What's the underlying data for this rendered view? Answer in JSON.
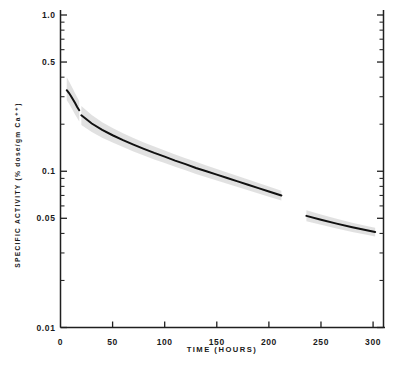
{
  "figure": {
    "background_color": "#ffffff",
    "ink_color": "#1a1a1a",
    "band_color": "#b8b8b8",
    "curve_color": "#111111"
  },
  "axes": {
    "x_title": "TIME (HOURS)",
    "y_title": "SPECIFIC ACTIVITY  (% dose/gm Ca⁺⁺)",
    "origin_label": "0",
    "x_tick_labels": [
      "50",
      "100",
      "150",
      "200",
      "250",
      "300"
    ],
    "y_tick_labels": [
      "1.0",
      "0.5",
      "0.1",
      "0.05",
      "0.01"
    ]
  },
  "chart_data": {
    "type": "line",
    "title": "",
    "subtitle": "",
    "xlabel": "TIME (HOURS)",
    "ylabel": "SPECIFIC ACTIVITY (% dose/gm Ca++)",
    "x_scale": "linear",
    "y_scale": "log",
    "xlim": [
      0,
      310
    ],
    "ylim": [
      0.01,
      1.0
    ],
    "grid": false,
    "legend": "none",
    "x_ticks": [
      0,
      50,
      100,
      150,
      200,
      250,
      300
    ],
    "y_ticks": [
      0.01,
      0.02,
      0.03,
      0.04,
      0.05,
      0.06,
      0.07,
      0.08,
      0.09,
      0.1,
      0.2,
      0.3,
      0.4,
      0.5,
      0.6,
      0.7,
      0.8,
      0.9,
      1.0
    ],
    "y_labeled_ticks": [
      {
        "value": 1.0,
        "label": "1.0"
      },
      {
        "value": 0.5,
        "label": "0.5"
      },
      {
        "value": 0.1,
        "label": "0.1"
      },
      {
        "value": 0.05,
        "label": "0.05"
      },
      {
        "value": 0.01,
        "label": "0.01"
      }
    ],
    "annotations": [
      "curve discontinuity between 212 and 236 hours"
    ],
    "series": [
      {
        "name": "segment-1-early",
        "x": [
          6,
          8,
          10,
          12,
          14,
          16,
          18
        ],
        "values": [
          0.33,
          0.318,
          0.303,
          0.288,
          0.273,
          0.258,
          0.246
        ],
        "band_upper": [
          0.4,
          0.378,
          0.356,
          0.336,
          0.316,
          0.298,
          0.282
        ],
        "band_lower": [
          0.285,
          0.272,
          0.258,
          0.244,
          0.231,
          0.219,
          0.208
        ]
      },
      {
        "name": "segment-2-main",
        "x": [
          20,
          30,
          40,
          50,
          60,
          70,
          80,
          90,
          100,
          110,
          120,
          130,
          140,
          150,
          160,
          170,
          180,
          190,
          200,
          212
        ],
        "values": [
          0.228,
          0.202,
          0.184,
          0.17,
          0.158,
          0.148,
          0.139,
          0.131,
          0.124,
          0.117,
          0.111,
          0.105,
          0.1,
          0.0952,
          0.0905,
          0.0862,
          0.082,
          0.078,
          0.0742,
          0.07
        ],
        "band_upper": [
          0.262,
          0.229,
          0.206,
          0.189,
          0.175,
          0.163,
          0.153,
          0.144,
          0.136,
          0.128,
          0.121,
          0.115,
          0.109,
          0.1035,
          0.0982,
          0.0933,
          0.0886,
          0.0841,
          0.0798,
          0.0751
        ],
        "band_lower": [
          0.198,
          0.178,
          0.164,
          0.153,
          0.143,
          0.134,
          0.126,
          0.119,
          0.1129,
          0.1068,
          0.1015,
          0.096,
          0.0916,
          0.0873,
          0.0831,
          0.0793,
          0.0756,
          0.0721,
          0.0688,
          0.065
        ]
      },
      {
        "name": "segment-3-late",
        "x": [
          236,
          250,
          265,
          280,
          295,
          302
        ],
        "values": [
          0.0518,
          0.0489,
          0.0462,
          0.0438,
          0.0417,
          0.0408
        ],
        "band_upper": [
          0.0562,
          0.0528,
          0.0497,
          0.0469,
          0.0445,
          0.0435
        ],
        "band_lower": [
          0.0479,
          0.0454,
          0.043,
          0.0409,
          0.0391,
          0.0383
        ]
      }
    ]
  }
}
